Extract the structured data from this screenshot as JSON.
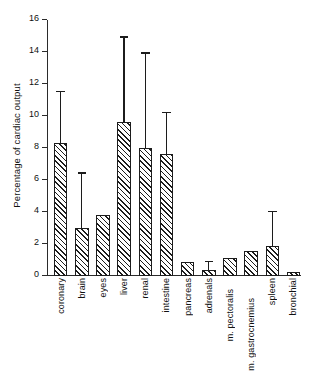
{
  "chart_data": {
    "type": "bar",
    "title": "",
    "xlabel": "",
    "ylabel": "Percentage of cardiac output",
    "ylim": [
      0,
      16
    ],
    "yticks": [
      0,
      2,
      4,
      6,
      8,
      10,
      12,
      14,
      16
    ],
    "ytick_labels": [
      "0",
      "2",
      "4",
      "6",
      "8",
      "10",
      "12",
      "14",
      "16"
    ],
    "grid": false,
    "legend": null,
    "error_bars": "upper only (SD)",
    "categories": [
      "coronary",
      "brain",
      "eyes",
      "liver",
      "renal",
      "intestine",
      "pancreas",
      "adrenals",
      "m. pectoralis",
      "m. gastrocnemius",
      "spleen",
      "bronchial"
    ],
    "values": [
      8.3,
      3.0,
      3.8,
      9.6,
      8.0,
      7.6,
      0.85,
      0.4,
      1.1,
      1.55,
      1.9,
      0.25
    ],
    "errors_upper": [
      11.5,
      6.4,
      null,
      14.9,
      13.9,
      10.2,
      null,
      0.85,
      null,
      null,
      4.0,
      null
    ]
  },
  "axis": {
    "y_title": "Percentage of cardiac output"
  }
}
